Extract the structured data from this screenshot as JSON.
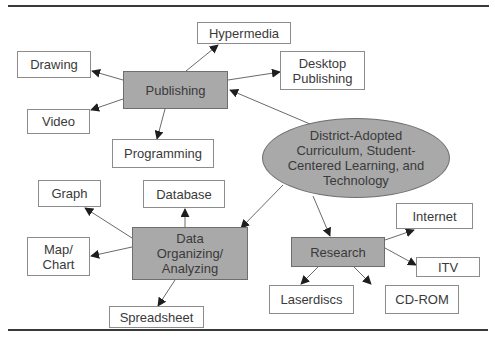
{
  "diagram": {
    "type": "concept-map",
    "colors": {
      "hub_fill": "#a9a9a9",
      "leaf_fill": "#ffffff",
      "border": "#8c8c8c",
      "text": "#3a3a3a",
      "rule": "#3a3a3a"
    },
    "center": {
      "id": "core",
      "label": "District-Adopted\nCurriculum, Student-\nCentered Learning, and\nTechnology"
    },
    "hubs": {
      "publishing": {
        "label": "Publishing"
      },
      "data": {
        "label": "Data\nOrganizing/\nAnalyzing"
      },
      "research": {
        "label": "Research"
      }
    },
    "leaves": {
      "hypermedia": {
        "label": "Hypermedia"
      },
      "drawing": {
        "label": "Drawing"
      },
      "desktop_publishing": {
        "label": "Desktop\nPublishing"
      },
      "video": {
        "label": "Video"
      },
      "programming": {
        "label": "Programming"
      },
      "graph": {
        "label": "Graph"
      },
      "database": {
        "label": "Database"
      },
      "map_chart": {
        "label": "Map/\nChart"
      },
      "spreadsheet": {
        "label": "Spreadsheet"
      },
      "internet": {
        "label": "Internet"
      },
      "itv": {
        "label": "ITV"
      },
      "laserdiscs": {
        "label": "Laserdiscs"
      },
      "cd_rom": {
        "label": "CD-ROM"
      }
    },
    "edges": [
      {
        "from": "core",
        "to": "publishing"
      },
      {
        "from": "core",
        "to": "data"
      },
      {
        "from": "core",
        "to": "research"
      },
      {
        "from": "publishing",
        "to": "hypermedia"
      },
      {
        "from": "publishing",
        "to": "drawing"
      },
      {
        "from": "publishing",
        "to": "desktop_publishing"
      },
      {
        "from": "publishing",
        "to": "video"
      },
      {
        "from": "publishing",
        "to": "programming"
      },
      {
        "from": "data",
        "to": "graph"
      },
      {
        "from": "data",
        "to": "database"
      },
      {
        "from": "data",
        "to": "map_chart"
      },
      {
        "from": "data",
        "to": "spreadsheet"
      },
      {
        "from": "research",
        "to": "internet"
      },
      {
        "from": "research",
        "to": "itv"
      },
      {
        "from": "research",
        "to": "laserdiscs"
      },
      {
        "from": "research",
        "to": "cd_rom"
      }
    ]
  }
}
